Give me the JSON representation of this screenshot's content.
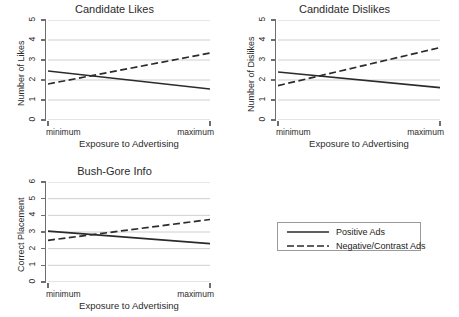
{
  "figure": {
    "background": "#ffffff",
    "line_color": "#2b2b2b",
    "grid_color": "#c9c9c9",
    "axis_color": "#6e6e6e"
  },
  "legend": {
    "items": [
      {
        "label": "Positive Ads",
        "style": "solid"
      },
      {
        "label": "Negative/Contrast Ads",
        "style": "dashed"
      }
    ]
  },
  "chart_data": [
    {
      "type": "line",
      "title": "Candidate Likes",
      "xlabel": "Exposure to Advertising",
      "ylabel": "Number of Likes",
      "x": [
        0,
        1
      ],
      "xticklabels": [
        "minimum",
        "maximum"
      ],
      "yticklabels": [
        "0",
        "1",
        "2",
        "3",
        "4",
        "5"
      ],
      "ylim": [
        0,
        5
      ],
      "yticks": [
        0,
        1,
        2,
        3,
        4,
        5
      ],
      "grid": true,
      "series": [
        {
          "name": "Positive Ads",
          "style": "solid",
          "values": [
            2.45,
            1.55
          ]
        },
        {
          "name": "Negative/Contrast Ads",
          "style": "dashed",
          "values": [
            1.8,
            3.35
          ]
        }
      ]
    },
    {
      "type": "line",
      "title": "Candidate Dislikes",
      "xlabel": "Exposure to Advertising",
      "ylabel": "Number of Dislikes",
      "x": [
        0,
        1
      ],
      "xticklabels": [
        "minimum",
        "maximum"
      ],
      "yticklabels": [
        "0",
        "1",
        "2",
        "3",
        "4",
        "5"
      ],
      "ylim": [
        0,
        5
      ],
      "yticks": [
        0,
        1,
        2,
        3,
        4,
        5
      ],
      "grid": true,
      "series": [
        {
          "name": "Positive Ads",
          "style": "solid",
          "values": [
            2.4,
            1.62
          ]
        },
        {
          "name": "Negative/Contrast Ads",
          "style": "dashed",
          "values": [
            1.72,
            3.62
          ]
        }
      ]
    },
    {
      "type": "line",
      "title": "Bush-Gore Info",
      "xlabel": "Exposure to Advertising",
      "ylabel": "Correct Placement",
      "x": [
        0,
        1
      ],
      "xticklabels": [
        "minimum",
        "maximum"
      ],
      "yticklabels": [
        "0",
        "1",
        "2",
        "3",
        "4",
        "5",
        "6"
      ],
      "ylim": [
        0,
        6
      ],
      "yticks": [
        0,
        1,
        2,
        3,
        4,
        5,
        6
      ],
      "grid": true,
      "series": [
        {
          "name": "Positive Ads",
          "style": "solid",
          "values": [
            3.05,
            2.3
          ]
        },
        {
          "name": "Negative/Contrast Ads",
          "style": "dashed",
          "values": [
            2.5,
            3.75
          ]
        }
      ]
    }
  ]
}
